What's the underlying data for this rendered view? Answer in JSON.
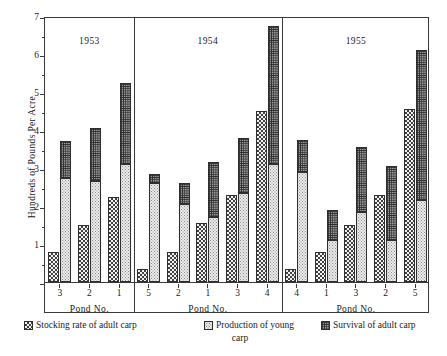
{
  "chart_data": {
    "type": "bar",
    "title": "",
    "xlabel": "Pond No.",
    "ylabel": "Hundreds of Pounds Per Acre",
    "ylim": [
      0,
      7
    ],
    "yticks": [
      0,
      1,
      2,
      3,
      4,
      5,
      6,
      7
    ],
    "ytick_labels": [
      "",
      "1",
      "2",
      "3",
      "4",
      "5",
      "6",
      "7"
    ],
    "minor_yticks": [
      0.5,
      1.5,
      2.5,
      3.5,
      4.5,
      5.5,
      6.5
    ],
    "grid": false,
    "legend_position": "bottom",
    "series": [
      {
        "name": "Stocking rate of adult carp",
        "pattern": "checkerboard-dark"
      },
      {
        "name": "Production of young carp",
        "pattern": "fine-dots-light"
      },
      {
        "name": "Survival of adult carp",
        "pattern": "dense-grid-dark"
      }
    ],
    "panels": [
      {
        "year": "1953",
        "categories": [
          "3",
          "2",
          "1"
        ],
        "groups": [
          {
            "pond": "3",
            "stocking_rate": 0.8,
            "production_young": 2.75,
            "survival_adult": 0.95,
            "right_total": 3.7
          },
          {
            "pond": "2",
            "stocking_rate": 1.5,
            "production_young": 2.65,
            "survival_adult": 1.4,
            "right_total": 4.05
          },
          {
            "pond": "1",
            "stocking_rate": 2.25,
            "production_young": 3.1,
            "survival_adult": 2.15,
            "right_total": 5.25
          }
        ]
      },
      {
        "year": "1954",
        "categories": [
          "5",
          "2",
          "1",
          "3",
          "4"
        ],
        "groups": [
          {
            "pond": "5",
            "stocking_rate": 0.35,
            "production_young": 2.6,
            "survival_adult": 0.25,
            "right_total": 2.85
          },
          {
            "pond": "2",
            "stocking_rate": 0.8,
            "production_young": 2.05,
            "survival_adult": 0.55,
            "right_total": 2.6
          },
          {
            "pond": "1",
            "stocking_rate": 1.55,
            "production_young": 1.7,
            "survival_adult": 1.45,
            "right_total": 3.15
          },
          {
            "pond": "3",
            "stocking_rate": 2.3,
            "production_young": 2.35,
            "survival_adult": 1.45,
            "right_total": 3.8
          },
          {
            "pond": "4",
            "stocking_rate": 4.5,
            "production_young": 3.1,
            "survival_adult": 3.65,
            "right_total": 6.75
          }
        ]
      },
      {
        "year": "1955",
        "categories": [
          "4",
          "1",
          "3",
          "2",
          "5"
        ],
        "groups": [
          {
            "pond": "4",
            "stocking_rate": 0.35,
            "production_young": 2.9,
            "survival_adult": 0.85,
            "right_total": 3.75
          },
          {
            "pond": "1",
            "stocking_rate": 0.8,
            "production_young": 1.1,
            "survival_adult": 0.8,
            "right_total": 1.9
          },
          {
            "pond": "3",
            "stocking_rate": 1.5,
            "production_young": 1.85,
            "survival_adult": 1.7,
            "right_total": 3.55
          },
          {
            "pond": "2",
            "stocking_rate": 2.3,
            "production_young": 1.1,
            "survival_adult": 1.95,
            "right_total": 3.05
          },
          {
            "pond": "5",
            "stocking_rate": 4.55,
            "production_young": 2.15,
            "survival_adult": 3.95,
            "right_total": 6.1
          }
        ]
      }
    ]
  },
  "axis": {
    "y_title": "Hundreds of Pounds Per Acre",
    "x_caption": "Pond No."
  },
  "legend": {
    "items": [
      {
        "label": "Stocking rate of adult carp",
        "key": "stocking"
      },
      {
        "label": "Production of young",
        "key": "young"
      },
      {
        "label": "Survival of adult carp",
        "key": "survival"
      }
    ],
    "continuation": "carp"
  },
  "colors": {
    "axis": "#3a3a3a",
    "stocking": "#404040",
    "young": "#8a8a8a",
    "survival": "#2b2b2b",
    "background": "#ffffff"
  }
}
